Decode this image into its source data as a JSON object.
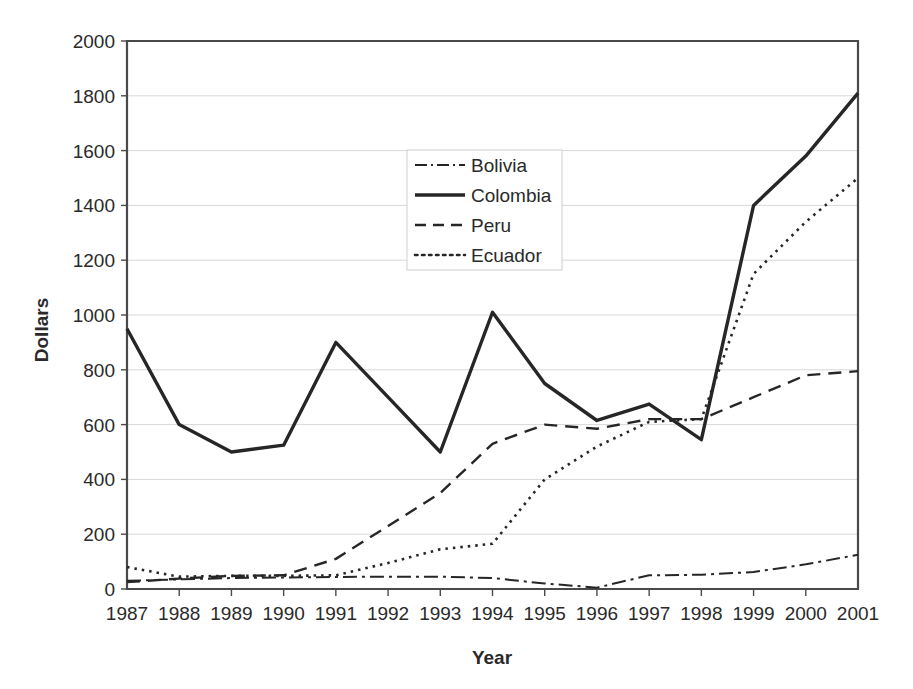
{
  "chart_data": {
    "type": "line",
    "title": "",
    "xlabel": "Year",
    "ylabel": "Dollars",
    "categories": [
      "1987",
      "1988",
      "1989",
      "1990",
      "1991",
      "1992",
      "1993",
      "1994",
      "1995",
      "1996",
      "1997",
      "1998",
      "1999",
      "2000",
      "2001"
    ],
    "x": [
      1987,
      1988,
      1989,
      1990,
      1991,
      1992,
      1993,
      1994,
      1995,
      1996,
      1997,
      1998,
      1999,
      2000,
      2001
    ],
    "xlim": [
      1987,
      2001
    ],
    "ylim": [
      0,
      2000
    ],
    "yticks": [
      0,
      200,
      400,
      600,
      800,
      1000,
      1200,
      1400,
      1600,
      1800,
      2000
    ],
    "ytick_labels": [
      "0",
      "200",
      "400",
      "600",
      "800",
      "1000",
      "1200",
      "1400",
      "1600",
      "1800",
      "2000"
    ],
    "grid": true,
    "grid_axis": "y",
    "legend_position": "upper-center",
    "series": [
      {
        "name": "Bolivia",
        "style": "dash-dot",
        "dasharray": "14,5,3,5",
        "width": 2.0,
        "color": "#262626",
        "values": [
          30,
          35,
          40,
          42,
          44,
          45,
          45,
          40,
          20,
          5,
          50,
          52,
          62,
          90,
          125
        ]
      },
      {
        "name": "Colombia",
        "style": "solid",
        "dasharray": "none",
        "width": 3.4,
        "color": "#262626",
        "values": [
          950,
          600,
          500,
          525,
          900,
          700,
          500,
          1010,
          750,
          615,
          675,
          545,
          1400,
          1580,
          1810
        ]
      },
      {
        "name": "Peru",
        "style": "dashed",
        "dasharray": "13,8",
        "width": 2.4,
        "color": "#262626",
        "values": [
          25,
          38,
          48,
          50,
          110,
          230,
          350,
          530,
          600,
          585,
          620,
          620,
          700,
          780,
          795
        ]
      },
      {
        "name": "Ecuador",
        "style": "dotted",
        "dasharray": "2.5,5",
        "width": 2.6,
        "color": "#262626",
        "values": [
          80,
          45,
          48,
          48,
          50,
          95,
          145,
          165,
          400,
          520,
          610,
          620,
          1150,
          1340,
          1500
        ]
      }
    ]
  },
  "legend": {
    "items": [
      {
        "label": "Bolivia",
        "style": "dash-dot",
        "dasharray": "12,4,2,4",
        "width": 2.0
      },
      {
        "label": "Colombia",
        "style": "solid",
        "dasharray": "none",
        "width": 3.4
      },
      {
        "label": "Peru",
        "style": "dashed",
        "dasharray": "11,7",
        "width": 2.4
      },
      {
        "label": "Ecuador",
        "style": "dotted",
        "dasharray": "2.5,4.5",
        "width": 2.6
      }
    ]
  },
  "plot_geometry": {
    "left": 127,
    "right": 858,
    "top": 41,
    "bottom": 589,
    "legend_left": 407,
    "legend_top": 150,
    "legend_right": 562,
    "legend_bottom": 270
  }
}
